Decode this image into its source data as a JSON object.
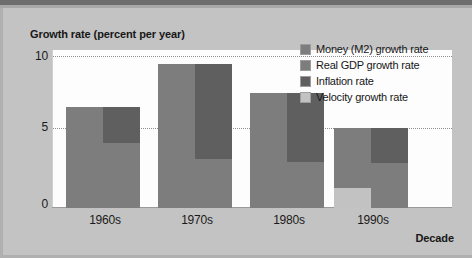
{
  "chart_data": {
    "type": "bar",
    "title": "Growth rate (percent per year)",
    "xlabel": "Decade",
    "ylabel": "Growth rate (percent per year)",
    "categories": [
      "1960s",
      "1970s",
      "1980s",
      "1990s"
    ],
    "ylim": [
      0,
      11
    ],
    "yticks": [
      "0",
      "5",
      "10"
    ],
    "ytick_values": [
      0,
      5,
      10
    ],
    "grid": "horizontal dotted at 5 and 10",
    "legend_position": "top-right inside plot",
    "layout": "paired bars per decade: left bar = Money (M2) growth rate (with Velocity growth rate stacked at its base); right bar = Real GDP growth rate with Inflation rate stacked on top",
    "series": [
      {
        "name": "Money (M2) growth rate",
        "color": "#7d7d7d",
        "values": [
          7.0,
          10.0,
          8.0,
          5.6
        ]
      },
      {
        "name": "Real GDP growth rate",
        "color": "#7d7d7d",
        "values": [
          4.5,
          3.4,
          3.2,
          3.1
        ]
      },
      {
        "name": "Inflation rate",
        "color": "#5f5f5f",
        "values": [
          2.5,
          6.6,
          4.8,
          2.5
        ]
      },
      {
        "name": "Velocity growth rate",
        "color": "#c2c2c2",
        "values": [
          0,
          0,
          0,
          1.4
        ]
      }
    ],
    "stacked_right_bar_totals": [
      7.0,
      10.0,
      8.0,
      5.6
    ]
  },
  "legend": {
    "items": [
      {
        "label": "Money (M2) growth rate",
        "color": "#7d7d7d"
      },
      {
        "label": "Real GDP growth rate",
        "color": "#7d7d7d"
      },
      {
        "label": "Inflation rate",
        "color": "#5f5f5f"
      },
      {
        "label": "Velocity growth rate",
        "color": "#c2c2c2"
      }
    ]
  },
  "axes": {
    "y_title": "Growth rate (percent per year)",
    "x_title": "Decade",
    "y_ticks": [
      "10",
      "5",
      "0"
    ]
  }
}
